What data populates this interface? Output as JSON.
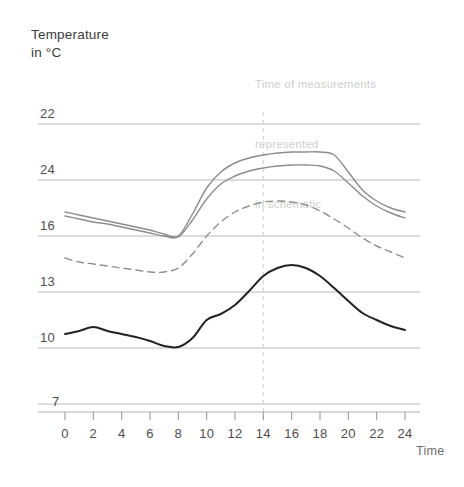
{
  "axis_title": "Temperature\nin °C",
  "annotation": {
    "line1": "Time of measurements",
    "line2": "represented",
    "line3": "in schematic"
  },
  "chart_data": {
    "type": "line",
    "title": "Temperature in °C",
    "xlabel": "Time",
    "ylabel": "Temperature in °C",
    "grid": true,
    "legend": "none",
    "annotations": [
      {
        "text": "Time of measurements represented in schematic",
        "x": 14,
        "kind": "vertical-dashed-marker"
      }
    ],
    "y_tick_labels": [
      "22",
      "24",
      "16",
      "13",
      "10",
      "7"
    ],
    "y_tick_pixels": [
      124,
      180,
      236,
      292,
      348,
      404
    ],
    "x_tick_labels": [
      "0",
      "2",
      "4",
      "6",
      "8",
      "10",
      "12",
      "14",
      "16",
      "18",
      "20",
      "22",
      "24"
    ],
    "x": [
      0,
      1,
      2,
      3,
      4,
      5,
      6,
      7,
      8,
      9,
      10,
      11,
      12,
      13,
      14,
      15,
      16,
      17,
      18,
      19,
      20,
      21,
      22,
      23,
      24
    ],
    "xlim": [
      0,
      24
    ],
    "series": [
      {
        "name": "upper-grey-curve",
        "color": "#8c8c8c",
        "style": "solid",
        "values_px": [
          212,
          215,
          218,
          221,
          224,
          227,
          230,
          234,
          236,
          214,
          188,
          172,
          163,
          158,
          155,
          153,
          152,
          152,
          152,
          155,
          172,
          190,
          201,
          208,
          212
        ]
      },
      {
        "name": "lower-grey-curve",
        "color": "#8c8c8c",
        "style": "solid",
        "values_px": [
          216,
          219,
          222,
          224,
          227,
          230,
          233,
          236,
          237,
          220,
          199,
          184,
          176,
          171,
          168,
          166,
          165,
          165,
          166,
          171,
          183,
          196,
          206,
          213,
          218
        ]
      },
      {
        "name": "dashed-curve",
        "color": "#8f8f8f",
        "style": "dashed",
        "values_px": [
          258,
          262,
          264,
          266,
          268,
          270,
          272,
          272,
          268,
          254,
          236,
          222,
          212,
          206,
          202,
          201,
          202,
          205,
          211,
          219,
          228,
          238,
          246,
          252,
          258
        ]
      },
      {
        "name": "black-curve",
        "color": "#222222",
        "style": "solid",
        "values_px": [
          334,
          331,
          327,
          331,
          334,
          337,
          341,
          346,
          347,
          338,
          320,
          314,
          305,
          291,
          276,
          268,
          265,
          268,
          276,
          288,
          301,
          313,
          320,
          326,
          330
        ]
      }
    ]
  }
}
